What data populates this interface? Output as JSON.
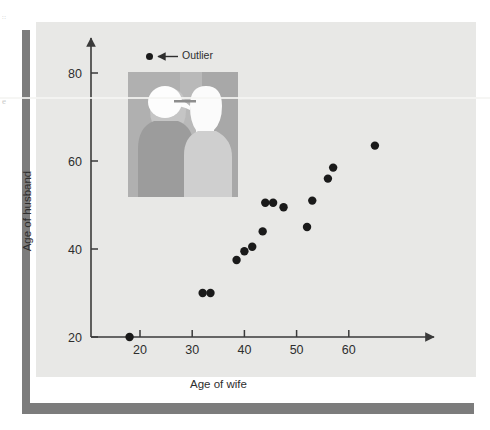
{
  "figure": {
    "legend_label": "Outlier",
    "legend_marker": "filled-circle",
    "legend_arrow": "left-arrow",
    "inset_caption": "couple-silhouette-photo",
    "colors": {
      "panel_background": "#e8e8e6",
      "card_background": "#ffffff",
      "shadow": "#7c7c7c",
      "marker": "#1a1a1a",
      "axis": "#3a3a3a",
      "text": "#2e2e2e"
    }
  },
  "chart_data": {
    "type": "scatter",
    "title": "",
    "xlabel": "Age of wife",
    "ylabel": "Age of husband",
    "xlim": [
      14,
      70
    ],
    "ylim": [
      18,
      86
    ],
    "xticks": [
      20,
      30,
      40,
      50,
      60
    ],
    "yticks": [
      20,
      40,
      60,
      80
    ],
    "grid": false,
    "legend_position": "top-left",
    "annotations": [
      {
        "text": "Outlier",
        "points_to": {
          "x": 18,
          "y": 20
        },
        "marker": "filled-circle",
        "arrow": "left"
      }
    ],
    "series": [
      {
        "name": "Married couples",
        "marker": "filled-circle",
        "color": "#1a1a1a",
        "points": [
          {
            "x": 18,
            "y": 20,
            "label": "outlier"
          },
          {
            "x": 32,
            "y": 30
          },
          {
            "x": 33.5,
            "y": 30
          },
          {
            "x": 38.5,
            "y": 37.5
          },
          {
            "x": 40,
            "y": 39.5
          },
          {
            "x": 41.5,
            "y": 40.5
          },
          {
            "x": 43.5,
            "y": 44
          },
          {
            "x": 44,
            "y": 50.5
          },
          {
            "x": 45.5,
            "y": 50.5
          },
          {
            "x": 47.5,
            "y": 49.5
          },
          {
            "x": 52,
            "y": 45
          },
          {
            "x": 53,
            "y": 51
          },
          {
            "x": 56,
            "y": 56
          },
          {
            "x": 57,
            "y": 58.5
          },
          {
            "x": 65,
            "y": 63.5
          }
        ]
      }
    ]
  },
  "scan_marks": {
    "top": "::",
    "middle": "e"
  }
}
